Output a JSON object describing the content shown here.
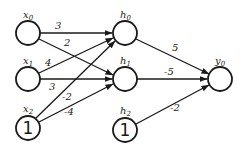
{
  "diagram": {
    "type": "neural-network",
    "layers": [
      {
        "name": "input",
        "nodes": [
          {
            "id": "x0",
            "base": "x",
            "sub": "0",
            "content": ""
          },
          {
            "id": "x1",
            "base": "x",
            "sub": "1",
            "content": ""
          },
          {
            "id": "x2",
            "base": "x",
            "sub": "2",
            "content": "1"
          }
        ]
      },
      {
        "name": "hidden",
        "nodes": [
          {
            "id": "h0",
            "base": "h",
            "sub": "0",
            "content": ""
          },
          {
            "id": "h1",
            "base": "h",
            "sub": "1",
            "content": ""
          },
          {
            "id": "h2",
            "base": "h",
            "sub": "2",
            "content": "1"
          }
        ]
      },
      {
        "name": "output",
        "nodes": [
          {
            "id": "y0",
            "base": "y",
            "sub": "0",
            "content": ""
          }
        ]
      }
    ],
    "edges": [
      {
        "from": "x0",
        "to": "h0",
        "weight": "3"
      },
      {
        "from": "x0",
        "to": "h1",
        "weight": "2"
      },
      {
        "from": "x1",
        "to": "h0",
        "weight": "4"
      },
      {
        "from": "x1",
        "to": "h1",
        "weight": "3"
      },
      {
        "from": "x2",
        "to": "h0",
        "weight": "-2"
      },
      {
        "from": "x2",
        "to": "h1",
        "weight": "-4"
      },
      {
        "from": "h0",
        "to": "y0",
        "weight": "5"
      },
      {
        "from": "h1",
        "to": "y0",
        "weight": "-5"
      },
      {
        "from": "h2",
        "to": "y0",
        "weight": "-2"
      }
    ]
  },
  "colors": {
    "stroke": "#1a1a1a",
    "background": "#ffffff"
  }
}
